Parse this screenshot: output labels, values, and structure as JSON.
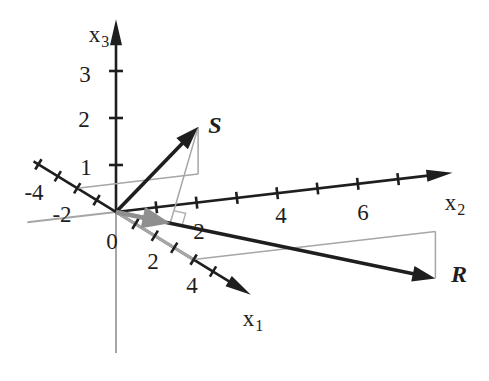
{
  "page": {
    "background": "#ffffff"
  },
  "chart_data": {
    "type": "3d-vector-projection-plot",
    "title": "",
    "axes": {
      "x1": {
        "name": "x",
        "subscript": "1",
        "range": [
          -4.25,
          6.95
        ],
        "ticks": [
          -4,
          -3,
          -2,
          -1,
          1,
          2,
          3,
          4,
          5
        ],
        "labeled_ticks": [
          -4,
          -2,
          2,
          4
        ]
      },
      "x2": {
        "name": "x",
        "subscript": "2",
        "range": [
          -2.2,
          8.35
        ],
        "ticks": [
          1,
          2,
          3,
          4,
          5,
          6,
          7
        ],
        "labeled_ticks": [
          2,
          4,
          6
        ]
      },
      "x3": {
        "name": "x",
        "subscript": "3",
        "range": [
          -3.0,
          4.1
        ],
        "ticks": [
          1,
          2,
          3
        ],
        "labeled_ticks": [
          1,
          2,
          3
        ]
      }
    },
    "origin_label": "0",
    "vectors": [
      {
        "name": "S",
        "components": [
          -2,
          3,
          1
        ]
      },
      {
        "name": "R",
        "components": [
          4,
          6,
          -1
        ]
      }
    ],
    "projection": {
      "of": "S",
      "onto": "R",
      "scalar_along_R": 0.17,
      "right_angle_marker": true
    },
    "construction_paths": [
      {
        "for": "S",
        "points": [
          [
            -2,
            0,
            0
          ],
          [
            -2,
            3,
            0
          ],
          [
            -2,
            3,
            1
          ]
        ],
        "widths": [
          1.5,
          1.5
        ]
      },
      {
        "for": "R",
        "points": [
          [
            0,
            0,
            0
          ],
          [
            4,
            0,
            0
          ],
          [
            4,
            6,
            0
          ],
          [
            4,
            6,
            -1
          ]
        ],
        "widths": [
          3.2,
          1.5,
          1.5
        ]
      }
    ],
    "colors": {
      "axis": "#1e1e1e",
      "vector": "#1e1e1e",
      "construction": "#a6a6a6",
      "negative_axis": "#a6a6a6",
      "projection_arrow": "#8f8f8f",
      "right_angle": "#b0b0b0",
      "label": "#1e1e1e"
    },
    "layout": {
      "width": 489,
      "height": 381,
      "origin": [
        116,
        212
      ],
      "e1": [
        19.4,
        11.9
      ],
      "e2": [
        40.3,
        -4.7
      ],
      "e3": [
        0,
        -47
      ],
      "axis_head": {
        "len": 26,
        "halfwidth": 6
      },
      "vector_head": {
        "len": 23,
        "halfwidth": 8
      },
      "projection_head": {
        "len": 28,
        "halfwidth": 11
      },
      "axis_width": 2.6,
      "vector_width": 3.6,
      "projection_width": 4.5,
      "tick_halflen": {
        "x1": 6,
        "x2": 6,
        "x3": 7
      },
      "axis_label_pos": {
        "x1": [
          253,
          318
        ],
        "x2": [
          455,
          202
        ],
        "x3": [
          99,
          34
        ]
      },
      "vector_label_pos": {
        "S": [
          215,
          125
        ],
        "R": [
          459,
          274
        ]
      },
      "origin_label_pos": [
        112,
        241
      ],
      "tick_label_pos": {
        "x1": {
          "-4": [
            34,
            192
          ],
          "-2": [
            62,
            214
          ],
          "2": [
            153,
            261
          ],
          "4": [
            192,
            285
          ]
        },
        "x2": {
          "2": [
            199,
            231
          ],
          "4": [
            281,
            215
          ],
          "6": [
            363,
            212
          ]
        },
        "x3": {
          "1": [
            86,
            167
          ],
          "2": [
            84,
            119
          ],
          "3": [
            85,
            74
          ]
        }
      },
      "font_size": {
        "tick": 23,
        "axis": 23,
        "axis_sub": 16,
        "vector": 24
      }
    }
  }
}
